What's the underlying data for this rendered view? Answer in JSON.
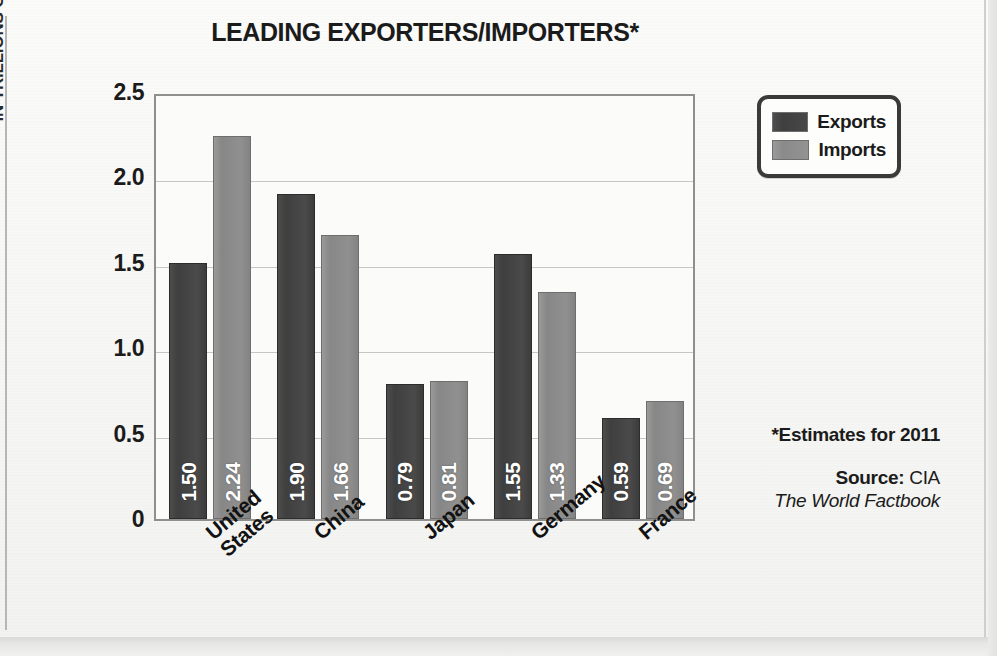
{
  "chart_data": {
    "type": "bar",
    "title": "LEADING EXPORTERS/IMPORTERS*",
    "xlabel": "",
    "ylabel": "IN TRILLIONS OF U.S. DOLLARS",
    "ylim": [
      0,
      2.5
    ],
    "grid": true,
    "legend_position": "top-right-outside",
    "categories": [
      "United States",
      "China",
      "Japan",
      "Germany",
      "France"
    ],
    "category_lines": [
      [
        "United",
        "States"
      ],
      [
        "China"
      ],
      [
        "Japan"
      ],
      [
        "Germany"
      ],
      [
        "France"
      ]
    ],
    "series": [
      {
        "name": "Exports",
        "color": "#454545",
        "values": [
          1.5,
          1.9,
          0.79,
          1.55,
          0.59
        ],
        "value_labels": [
          "1.50",
          "1.90",
          "0.79",
          "1.55",
          "0.59"
        ]
      },
      {
        "name": "Imports",
        "color": "#8f8f8f",
        "values": [
          2.24,
          1.66,
          0.81,
          1.33,
          0.69
        ],
        "value_labels": [
          "2.24",
          "1.66",
          "0.81",
          "1.33",
          "0.69"
        ]
      }
    ],
    "ytick_labels": [
      "2.5",
      "2.0",
      "1.5",
      "1.0",
      "0.5",
      "0"
    ],
    "ytick_values": [
      2.5,
      2.0,
      1.5,
      1.0,
      0.5,
      0
    ],
    "annotations": {
      "footnote": "*Estimates for 2011",
      "source_label": "Source:",
      "source_value": " CIA",
      "source_publication": "The World Factbook"
    }
  },
  "legend": {
    "items": [
      {
        "label": "Exports",
        "swatch": "exports"
      },
      {
        "label": "Imports",
        "swatch": "imports"
      }
    ]
  }
}
